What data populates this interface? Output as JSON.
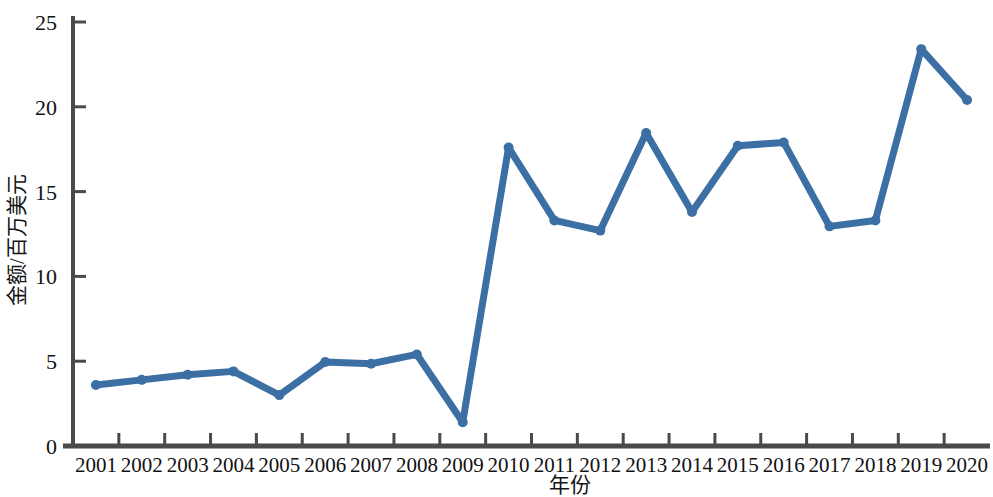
{
  "chart_data": {
    "type": "line",
    "title": "",
    "xlabel": "年份",
    "ylabel": "金额/百万美元",
    "categories": [
      "2001",
      "2002",
      "2003",
      "2004",
      "2005",
      "2006",
      "2007",
      "2008",
      "2009",
      "2010",
      "2011",
      "2012",
      "2013",
      "2014",
      "2015",
      "2016",
      "2017",
      "2018",
      "2019",
      "2020"
    ],
    "values": [
      3.6,
      3.9,
      4.2,
      4.4,
      3.0,
      4.95,
      4.85,
      5.4,
      1.4,
      17.6,
      13.3,
      12.7,
      18.45,
      13.8,
      17.7,
      17.9,
      12.95,
      13.3,
      23.4,
      20.4
    ],
    "series": [
      {
        "name": "金额",
        "values": [
          3.6,
          3.9,
          4.2,
          4.4,
          3.0,
          4.95,
          4.85,
          5.4,
          1.4,
          17.6,
          13.3,
          12.7,
          18.45,
          13.8,
          17.7,
          17.9,
          12.95,
          13.3,
          23.4,
          20.4
        ]
      }
    ],
    "ylim": [
      0,
      25
    ],
    "y_ticks": [
      0,
      5,
      10,
      15,
      20,
      25
    ],
    "y_tick_labels": [
      "0",
      "5",
      "10",
      "15",
      "20",
      "25"
    ],
    "grid": false,
    "legend": "none",
    "line_color": "#3c6fa4",
    "marker_color": "#3c6fa4",
    "axis_color": "#4a4a4a",
    "background_color": "#ffffff",
    "line_width": 7,
    "marker_size": 5
  }
}
